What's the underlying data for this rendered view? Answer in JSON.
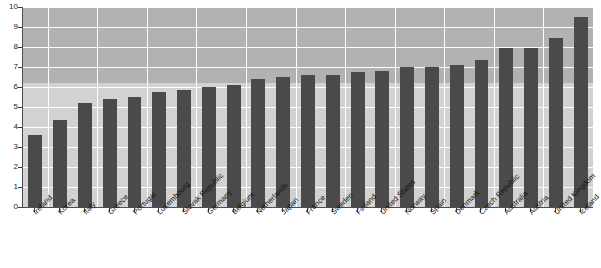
{
  "chart_data": {
    "type": "bar",
    "title": "",
    "subtitle": "",
    "xlabel": "",
    "ylabel": "",
    "ylim": [
      0,
      10
    ],
    "ytick_step": 1,
    "yticks": [
      "0",
      "1",
      "2",
      "3",
      "4",
      "5",
      "6",
      "7",
      "8",
      "9",
      "10"
    ],
    "grid": true,
    "legend": "none",
    "bar_color": "#4a4a4a",
    "plot_background_upper": "#b2b2b2",
    "plot_background_lower": "#d2d2d2",
    "gridline_color": "#fdfdfd",
    "categories": [
      "Ireland",
      "Korea",
      "Italy",
      "Greece",
      "Portugal",
      "Luxembourg",
      "Slovak Republic",
      "Germany",
      "Belgium",
      "Netherlands",
      "Japan",
      "France",
      "Sweden",
      "Finland",
      "United States",
      "Norway",
      "Spain",
      "Denmark",
      "Czech Republic",
      "Australia",
      "Austria",
      "United Kingdom",
      "Iceland"
    ],
    "values": [
      3.6,
      4.35,
      5.2,
      5.4,
      5.5,
      5.75,
      5.85,
      6.0,
      6.1,
      6.4,
      6.5,
      6.6,
      6.6,
      6.75,
      6.8,
      7.0,
      7.0,
      7.1,
      7.35,
      7.95,
      7.95,
      8.45,
      9.5
    ]
  }
}
